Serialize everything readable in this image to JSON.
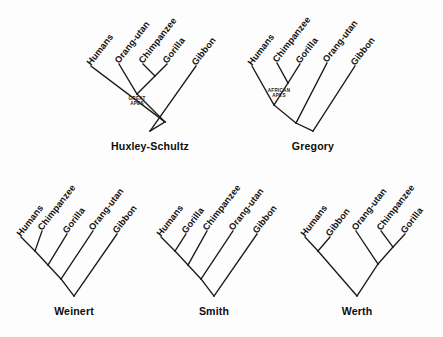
{
  "figure": {
    "background_color": "#fdfdfd",
    "line_color": "#1b1b1b",
    "text_color": "#0d0d0d",
    "width": 443,
    "height": 337
  },
  "taxa": {
    "humans": "Humans",
    "chimpanzee": "Chimpanzee",
    "gorilla": "Gorilla",
    "orangutan": "Orang-utan",
    "gibbon": "Gibbon"
  },
  "clade_labels": {
    "great_apes": "GREAT APES",
    "great_apes_line1": "GREAT",
    "great_apes_line2": "APES",
    "african_apes": "AFRICAN APES",
    "african_apes_line1": "AFRICAN",
    "african_apes_line2": "APES"
  },
  "trees": [
    {
      "id": "huxley-schultz",
      "name": "Huxley-Schultz",
      "row": 0,
      "column": 0,
      "origin_x": 150,
      "origin_y": 131,
      "name_x": 150,
      "name_y": 150,
      "tips": [
        {
          "id": "humans",
          "label": "Humans",
          "x": 91,
          "y": 66
        },
        {
          "id": "orangutan",
          "label": "Orang-utan",
          "x": 119,
          "y": 64
        },
        {
          "id": "chimpanzee",
          "label": "Chimpanzee",
          "x": 143,
          "y": 64
        },
        {
          "id": "gorilla",
          "label": "Gorilla",
          "x": 167,
          "y": 64
        },
        {
          "id": "gibbon",
          "label": "Gibbon",
          "x": 196,
          "y": 66
        }
      ],
      "nodes": [
        {
          "id": "n_chimp_gor",
          "x": 155,
          "y": 76,
          "children": [
            "chimpanzee",
            "gorilla"
          ]
        },
        {
          "id": "n_great_apes",
          "x": 137,
          "y": 94,
          "children": [
            "orangutan",
            "n_chimp_gor"
          ],
          "clade_label": "great_apes",
          "label_x": 137,
          "label_y": 100
        },
        {
          "id": "n_hominoid",
          "x": 165,
          "y": 122,
          "children": [
            "humans",
            "n_great_apes"
          ]
        },
        {
          "id": "n_root",
          "x": 150,
          "y": 131,
          "children": [
            "n_hominoid",
            "gibbon"
          ],
          "is_root": true
        }
      ]
    },
    {
      "id": "gregory",
      "name": "Gregory",
      "row": 0,
      "column": 1,
      "origin_x": 313,
      "origin_y": 131,
      "name_x": 313,
      "name_y": 150,
      "tips": [
        {
          "id": "humans",
          "label": "Humans",
          "x": 252,
          "y": 66
        },
        {
          "id": "chimpanzee",
          "label": "Chimpanzee",
          "x": 277,
          "y": 63
        },
        {
          "id": "gorilla",
          "label": "Gorilla",
          "x": 300,
          "y": 64
        },
        {
          "id": "orangutan",
          "label": "Orang-utan",
          "x": 327,
          "y": 63
        },
        {
          "id": "gibbon",
          "label": "Gibbon",
          "x": 355,
          "y": 66
        }
      ],
      "nodes": [
        {
          "id": "n_african",
          "x": 288,
          "y": 83,
          "children": [
            "chimpanzee",
            "gorilla"
          ],
          "clade_label": "african_apes",
          "label_x": 279,
          "label_y": 92
        },
        {
          "id": "n_homin",
          "x": 274,
          "y": 105,
          "children": [
            "humans",
            "n_african"
          ]
        },
        {
          "id": "n_great",
          "x": 296,
          "y": 123,
          "children": [
            "n_homin",
            "orangutan"
          ]
        },
        {
          "id": "n_root",
          "x": 313,
          "y": 131,
          "children": [
            "n_great",
            "gibbon"
          ],
          "is_root": true
        }
      ]
    },
    {
      "id": "weinert",
      "name": "Weinert",
      "row": 1,
      "column": 0,
      "origin_x": 74,
      "origin_y": 296,
      "name_x": 74,
      "name_y": 315,
      "tips": [
        {
          "id": "humans",
          "label": "Humans",
          "x": 21,
          "y": 237
        },
        {
          "id": "chimpanzee",
          "label": "Chimpanzee",
          "x": 42,
          "y": 231
        },
        {
          "id": "gorilla",
          "label": "Gorilla",
          "x": 67,
          "y": 234
        },
        {
          "id": "orangutan",
          "label": "Orang-utan",
          "x": 93,
          "y": 231
        },
        {
          "id": "gibbon",
          "label": "Gibbon",
          "x": 117,
          "y": 234
        }
      ],
      "nodes": [
        {
          "id": "n1",
          "x": 35,
          "y": 251,
          "children": [
            "humans",
            "chimpanzee"
          ]
        },
        {
          "id": "n2",
          "x": 48,
          "y": 265,
          "children": [
            "n1",
            "gorilla"
          ]
        },
        {
          "id": "n3",
          "x": 61,
          "y": 279,
          "children": [
            "n2",
            "orangutan"
          ]
        },
        {
          "id": "n4",
          "x": 74,
          "y": 296,
          "children": [
            "n3",
            "gibbon"
          ],
          "is_root": true
        }
      ]
    },
    {
      "id": "smith",
      "name": "Smith",
      "row": 1,
      "column": 1,
      "origin_x": 214,
      "origin_y": 296,
      "name_x": 214,
      "name_y": 315,
      "tips": [
        {
          "id": "humans",
          "label": "Humans",
          "x": 161,
          "y": 237
        },
        {
          "id": "gorilla",
          "label": "Gorilla",
          "x": 186,
          "y": 234
        },
        {
          "id": "chimpanzee",
          "label": "Chimpanzee",
          "x": 207,
          "y": 231
        },
        {
          "id": "orangutan",
          "label": "Orang-utan",
          "x": 233,
          "y": 231
        },
        {
          "id": "gibbon",
          "label": "Gibbon",
          "x": 257,
          "y": 234
        }
      ],
      "nodes": [
        {
          "id": "n1",
          "x": 175,
          "y": 251,
          "children": [
            "humans",
            "gorilla"
          ]
        },
        {
          "id": "n2",
          "x": 188,
          "y": 265,
          "children": [
            "n1",
            "chimpanzee"
          ]
        },
        {
          "id": "n3",
          "x": 201,
          "y": 279,
          "children": [
            "n2",
            "orangutan"
          ]
        },
        {
          "id": "n4",
          "x": 214,
          "y": 296,
          "children": [
            "n3",
            "gibbon"
          ],
          "is_root": true
        }
      ]
    },
    {
      "id": "werth",
      "name": "Werth",
      "row": 1,
      "column": 2,
      "origin_x": 357,
      "origin_y": 296,
      "name_x": 357,
      "name_y": 315,
      "tips": [
        {
          "id": "humans",
          "label": "Humans",
          "x": 305,
          "y": 237
        },
        {
          "id": "gibbon",
          "label": "Gibbon",
          "x": 330,
          "y": 237
        },
        {
          "id": "orangutan",
          "label": "Orang-utan",
          "x": 356,
          "y": 231
        },
        {
          "id": "chimpanzee",
          "label": "Chimpanzee",
          "x": 381,
          "y": 231
        },
        {
          "id": "gorilla",
          "label": "Gorilla",
          "x": 405,
          "y": 234
        }
      ],
      "nodes": [
        {
          "id": "n_hum_gib",
          "x": 318,
          "y": 251,
          "children": [
            "humans",
            "gibbon"
          ]
        },
        {
          "id": "n_chi_gor",
          "x": 393,
          "y": 247,
          "children": [
            "chimpanzee",
            "gorilla"
          ]
        },
        {
          "id": "n_oran_afr",
          "x": 378,
          "y": 264,
          "children": [
            "orangutan",
            "n_chi_gor"
          ]
        },
        {
          "id": "n_root",
          "x": 357,
          "y": 296,
          "children": [
            "n_hum_gib",
            "n_oran_afr"
          ],
          "is_root": true
        }
      ]
    }
  ],
  "label_rotation_deg": -52
}
